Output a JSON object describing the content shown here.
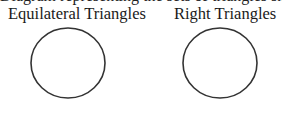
{
  "cutoff_text": "Diagram representing the sets of triangles shown",
  "sets": [
    {
      "label": "Equilateral Triangles",
      "cx": 68,
      "cy": 63,
      "rx": 37,
      "ry": 35
    },
    {
      "label": "Right Triangles",
      "cx": 220,
      "cy": 63,
      "rx": 37,
      "ry": 35
    }
  ],
  "colors": {
    "stroke": "#333333",
    "background": "#ffffff"
  }
}
